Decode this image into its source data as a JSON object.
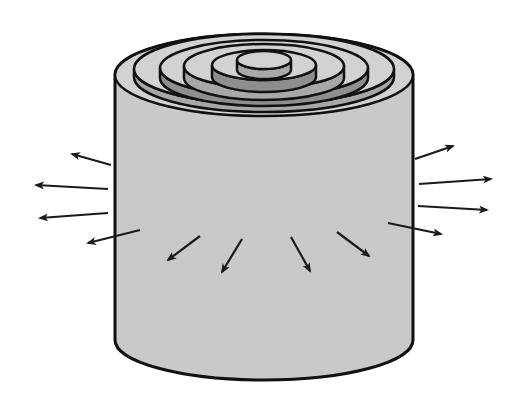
{
  "diagram": {
    "colors": {
      "background": "#ffffff",
      "cylinder_body": "#c9c9c9",
      "outline": "#111111",
      "ring_top_light": "#d2d2d2",
      "ring_side_mid": "#a8a8a8",
      "ring_side_dark": "#8e8e8e",
      "arrow": "#1a1a1a"
    },
    "cylinder": {
      "left_x": 115,
      "right_x": 413,
      "top_cy": 75,
      "top_rx": 149,
      "top_ry": 41,
      "bottom_y": 340,
      "bottom_ry": 40
    },
    "rings": [
      {
        "rx": 149,
        "ry": 41,
        "cy": 75,
        "depth": 0
      },
      {
        "rx": 130,
        "ry": 35,
        "cy": 77,
        "depth": 8
      },
      {
        "rx": 104,
        "ry": 28,
        "cy": 78,
        "depth": 10
      },
      {
        "rx": 80,
        "ry": 22,
        "cy": 78,
        "depth": 12
      },
      {
        "rx": 52,
        "ry": 15,
        "cy": 77,
        "depth": 12
      },
      {
        "rx": 27,
        "ry": 9,
        "cy": 70,
        "depth": 10
      }
    ],
    "arrows": [
      {
        "side": "left",
        "x1": 111,
        "y1": 165,
        "x2": 72,
        "y2": 154
      },
      {
        "side": "left",
        "x1": 108,
        "y1": 189,
        "x2": 36,
        "y2": 185
      },
      {
        "side": "left",
        "x1": 108,
        "y1": 213,
        "x2": 40,
        "y2": 218
      },
      {
        "side": "left",
        "x1": 140,
        "y1": 230,
        "x2": 88,
        "y2": 243
      },
      {
        "side": "front",
        "x1": 200,
        "y1": 236,
        "x2": 168,
        "y2": 260
      },
      {
        "side": "front",
        "x1": 242,
        "y1": 239,
        "x2": 222,
        "y2": 272
      },
      {
        "side": "front",
        "x1": 291,
        "y1": 237,
        "x2": 310,
        "y2": 271
      },
      {
        "side": "front",
        "x1": 337,
        "y1": 232,
        "x2": 369,
        "y2": 256
      },
      {
        "side": "right",
        "x1": 415,
        "y1": 159,
        "x2": 453,
        "y2": 146
      },
      {
        "side": "right",
        "x1": 419,
        "y1": 184,
        "x2": 491,
        "y2": 179
      },
      {
        "side": "right",
        "x1": 418,
        "y1": 206,
        "x2": 487,
        "y2": 210
      },
      {
        "side": "right",
        "x1": 388,
        "y1": 223,
        "x2": 441,
        "y2": 234
      }
    ]
  }
}
